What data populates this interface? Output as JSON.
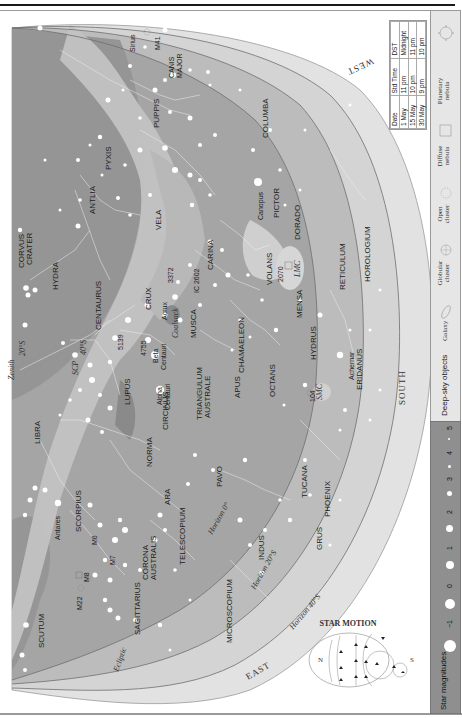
{
  "chart": {
    "directions": {
      "west": "WEST",
      "south": "SOUTH",
      "east": "EAST"
    },
    "zenith_label": "Zenith",
    "ecliptic_label": "Ecliptic",
    "horizons": [
      "Horizon 0°",
      "Horizon 20°S",
      "Horizon 40°S"
    ],
    "latitude_marks": [
      "20°S",
      "40°S",
      "SCP"
    ],
    "colors": {
      "sky_dark": "#8c8c8c",
      "sky_mid": "#a6a6a6",
      "milky_way": "#c4c4c4",
      "horizon_band": "#d2d2d2",
      "outer_band": "#e2e2e2",
      "star": "#ffffff",
      "line": "#e8e8e8"
    },
    "constellations": [
      "CANIS MAJOR",
      "PUPPIS",
      "COLUMBA",
      "PYXIS",
      "ANTLIA",
      "VELA",
      "PICTOR",
      "DORADO",
      "CORVUS",
      "CRATER",
      "HYDRA",
      "CENTAURUS",
      "CRUX",
      "CARINA",
      "VOLANS",
      "RETICULUM",
      "HOROLOGIUM",
      "MUSCA",
      "CHAMAELEON",
      "MENSA",
      "LUPUS",
      "CIRCINUS",
      "TRIANGULUM AUSTRALE",
      "APUS",
      "OCTANS",
      "HYDRUS",
      "ERIDANUS",
      "LIBRA",
      "NORMA",
      "PAVO",
      "TUCANA",
      "PHOENIX",
      "SCORPIUS",
      "ARA",
      "CORONA AUSTRALIS",
      "TELESCOPIUM",
      "INDUS",
      "GRUS",
      "SAGITTARIUS",
      "MICROSCOPIUM",
      "SCUTUM"
    ],
    "stars": [
      "Sirius",
      "Canopus",
      "Acrux",
      "Beta Centauri",
      "Alpha Centauri",
      "Achernar",
      "Antares"
    ],
    "deep_sky": [
      "M41",
      "3372",
      "IC 2602",
      "5139",
      "4755",
      "Coalsack",
      "2070",
      "LMC",
      "104",
      "SMC",
      "M6",
      "M7",
      "M8",
      "M22"
    ]
  },
  "star_motion": {
    "title": "STAR MOTION",
    "left": "N",
    "right": "S"
  },
  "time_table": {
    "headers": [
      "Date",
      "Std Time",
      "DST"
    ],
    "rows": [
      [
        "1 May",
        "11 pm",
        "Midnight"
      ],
      [
        "15 May",
        "10 pm",
        "11 pm"
      ],
      [
        "30 May",
        "9 pm",
        "10 pm"
      ]
    ]
  },
  "legend": {
    "deep_sky_title": "Deep-sky objects",
    "deep_sky_items": [
      {
        "label": "Galaxy",
        "icon": "galaxy-ellipse"
      },
      {
        "label": "Globular cluster",
        "icon": "globular-cluster"
      },
      {
        "label": "Open cluster",
        "icon": "open-cluster"
      },
      {
        "label": "Diffuse nebula",
        "icon": "diffuse-nebula-square"
      },
      {
        "label": "Planetary nebula",
        "icon": "planetary-nebula-circle"
      }
    ],
    "mag_title": "Star magnitudes",
    "magnitudes": [
      "−1",
      "0",
      "1",
      "2",
      "3",
      "4",
      "5"
    ]
  }
}
